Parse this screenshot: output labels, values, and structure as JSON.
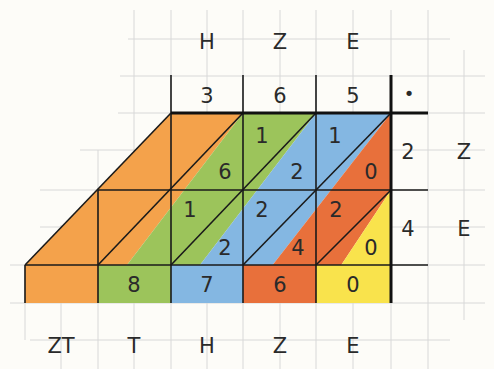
{
  "header_labels": [
    "H",
    "Z",
    "E"
  ],
  "multiplicand_digits": [
    "3",
    "6",
    "5"
  ],
  "dot_symbol": "•",
  "multiplier_digits": [
    "2",
    "4"
  ],
  "multiplier_labels": [
    "Z",
    "E"
  ],
  "cells": {
    "r0c0": {
      "top": "",
      "bottom": "6"
    },
    "r0c1": {
      "top": "1",
      "bottom": "2"
    },
    "r0c2": {
      "top": "1",
      "bottom": "0"
    },
    "r1c0": {
      "top": "1",
      "bottom": "2"
    },
    "r1c1": {
      "top": "2",
      "bottom": "4"
    },
    "r1c2": {
      "top": "2",
      "bottom": "0"
    }
  },
  "result_digits": [
    "",
    "8",
    "7",
    "6",
    "0"
  ],
  "bottom_labels": [
    "ZT",
    "T",
    "H",
    "Z",
    "E"
  ],
  "colors": {
    "orange": "#F4A24B",
    "green": "#9CC45B",
    "blue": "#84B7E2",
    "red_orange": "#E8703B",
    "yellow": "#F9E34C",
    "grid": "#d6d6d6",
    "line": "#1a1a1a"
  }
}
